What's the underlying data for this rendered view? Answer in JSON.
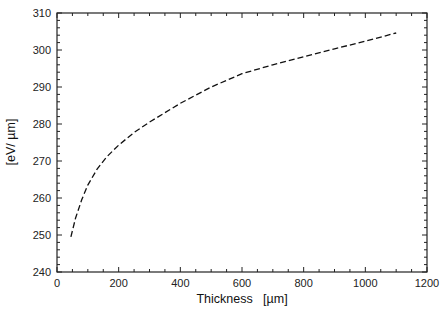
{
  "chart_data": {
    "type": "line",
    "title": "",
    "xlabel": "Thickness   [µm]",
    "ylabel": "[eV/ µm]",
    "xlim": [
      0,
      1200
    ],
    "ylim": [
      240,
      310
    ],
    "xticks": [
      0,
      200,
      400,
      600,
      800,
      1000,
      1200
    ],
    "yticks": [
      240,
      250,
      260,
      270,
      280,
      290,
      300,
      310
    ],
    "grid": false,
    "legend": null,
    "series": [
      {
        "name": "curve",
        "style": "dashed",
        "color": "#111111",
        "x": [
          45,
          60,
          80,
          100,
          130,
          160,
          200,
          250,
          300,
          400,
          500,
          600,
          700,
          800,
          900,
          1000,
          1100
        ],
        "y": [
          249.5,
          254.5,
          259.5,
          263.5,
          267.8,
          271.0,
          274.3,
          277.7,
          280.5,
          285.6,
          290.0,
          293.6,
          296.0,
          298.2,
          300.3,
          302.4,
          304.6
        ]
      }
    ]
  }
}
